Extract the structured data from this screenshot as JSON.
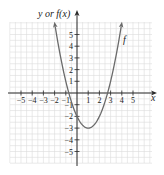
{
  "chart_data": {
    "type": "line",
    "title": "",
    "xlabel": "x",
    "ylabel": "y or f(x)",
    "xlim": [
      -6,
      6.8
    ],
    "ylim": [
      -6,
      7
    ],
    "grid": true,
    "grid_step": 0.5,
    "x_ticks": [
      -5,
      -4,
      -3,
      -2,
      -1,
      1,
      2,
      3,
      4,
      5
    ],
    "x_tick_labels": [
      "−5",
      "−4",
      "−3",
      "−2",
      "−1",
      "1",
      "2",
      "3",
      "4",
      "5"
    ],
    "y_ticks": [
      5,
      4,
      3,
      2,
      1,
      -1,
      -2,
      -3,
      -4,
      -5
    ],
    "y_tick_labels": [
      "5",
      "4",
      "3",
      "2",
      "1",
      "−1",
      "−2",
      "−3",
      "−4",
      "−5"
    ],
    "series": [
      {
        "name": "f",
        "equation": "f(x) = x^2 - 2x - 2",
        "x": [
          -2,
          -1.5,
          -1,
          -0.5,
          0,
          0.5,
          1,
          1.5,
          2,
          2.5,
          3,
          3.5,
          4
        ],
        "y": [
          6,
          3.25,
          1,
          -0.75,
          -2,
          -2.75,
          -3,
          -2.75,
          -2,
          -0.75,
          1,
          3.25,
          6
        ],
        "vertex": [
          1,
          -3
        ],
        "y_intercept": -2,
        "x_intercepts": [
          -0.73,
          2.73
        ],
        "arrows_at_ends": true
      }
    ],
    "annotations": [
      {
        "text": "f",
        "x": 4.3,
        "y": 4.2
      }
    ]
  },
  "labels": {
    "y_axis": "y or f(x)",
    "x_axis": "x",
    "curve": "f"
  },
  "colors": {
    "axis": "#2a2a2a",
    "grid": "#dcdcdc",
    "curve": "#6a6a6a"
  }
}
